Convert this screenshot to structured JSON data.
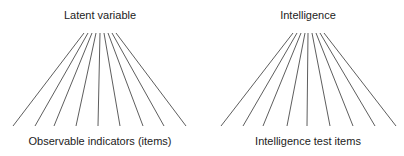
{
  "diagrams": [
    {
      "top_label": "Latent variable",
      "bottom_label": "Observable indicators (items)",
      "top_label_x": 100,
      "top_label_y": 9,
      "bottom_label_x": 100,
      "bottom_label_y": 135,
      "tops": [
        84,
        88,
        92,
        96,
        100,
        104,
        108,
        112,
        116
      ],
      "top_y": 33,
      "bottoms": [
        13,
        35,
        54,
        76,
        98,
        120,
        143,
        164,
        186
      ],
      "bottom_y": 126
    },
    {
      "top_label": "Intelligence",
      "bottom_label": "Intelligence test items",
      "top_label_x": 308,
      "top_label_y": 9,
      "bottom_label_x": 308,
      "bottom_label_y": 135,
      "tops": [
        293,
        297,
        301,
        305,
        308,
        312,
        316,
        320,
        324
      ],
      "top_y": 33,
      "bottoms": [
        221,
        243,
        263,
        287,
        307,
        330,
        353,
        375,
        396
      ],
      "bottom_y": 126
    }
  ],
  "line_color": "#333333"
}
